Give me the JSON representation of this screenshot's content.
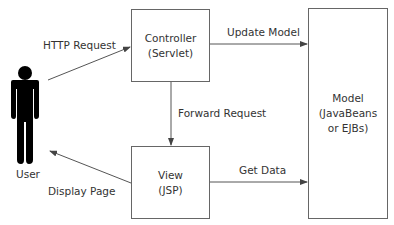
{
  "diagram": {
    "colors": {
      "line": "#555555",
      "figure": "#000000",
      "text": "#333333",
      "box_border": "#666666"
    },
    "actor": {
      "label": "User",
      "icon": "person-icon"
    },
    "nodes": {
      "controller": {
        "line1": "Controller",
        "line2": "(Servlet)"
      },
      "view": {
        "line1": "View",
        "line2": "(JSP)"
      },
      "model": {
        "line1": "Model",
        "line2": "(JavaBeans",
        "line3": "or EJBs)"
      }
    },
    "edges": {
      "http_request": {
        "label": "HTTP Request",
        "from": "User",
        "to": "Controller"
      },
      "update_model": {
        "label": "Update Model",
        "from": "Controller",
        "to": "Model"
      },
      "forward_request": {
        "label": "Forward Request",
        "from": "Controller",
        "to": "View"
      },
      "get_data": {
        "label": "Get Data",
        "from": "View",
        "to": "Model"
      },
      "display_page": {
        "label": "Display Page",
        "from": "View",
        "to": "User"
      }
    }
  }
}
